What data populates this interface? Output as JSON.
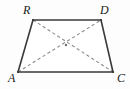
{
  "figure": {
    "kind": "geometry-diagram",
    "shape_name": "trapezoid",
    "canvas": {
      "width": 130,
      "height": 89,
      "background": "#fdfdfd"
    },
    "stroke_colors": {
      "edge": "#3a3a3a",
      "diagonal": "#8d8d8d",
      "vertex_dot": "#3a3a3a",
      "center_dot": "#6f6f6f",
      "label": "#1a1a1a"
    },
    "vertices": [
      {
        "id": "A",
        "label": "A",
        "x": 18,
        "y": 72,
        "label_x": 8,
        "label_y": 72
      },
      {
        "id": "R",
        "label": "R",
        "x": 33,
        "y": 20,
        "label_x": 23,
        "label_y": 4
      },
      {
        "id": "D",
        "label": "D",
        "x": 101,
        "y": 20,
        "label_x": 100,
        "label_y": 4
      },
      {
        "id": "C",
        "label": "C",
        "x": 113,
        "y": 72,
        "label_x": 117,
        "label_y": 72
      }
    ],
    "edges": [
      {
        "id": "RD",
        "from": "R",
        "to": "D",
        "style": "solid",
        "role": "top-base"
      },
      {
        "id": "DC",
        "from": "D",
        "to": "C",
        "style": "solid",
        "role": "right-leg"
      },
      {
        "id": "CA",
        "from": "C",
        "to": "A",
        "style": "solid",
        "role": "bottom-base"
      },
      {
        "id": "AR",
        "from": "A",
        "to": "R",
        "style": "solid",
        "role": "left-leg"
      }
    ],
    "diagonals": [
      {
        "id": "AD",
        "from": "A",
        "to": "D",
        "style": "dashed"
      },
      {
        "id": "RC",
        "from": "R",
        "to": "C",
        "style": "dashed"
      }
    ],
    "center_point": {
      "id": "O",
      "x": 66,
      "y": 45,
      "marked": true
    }
  }
}
